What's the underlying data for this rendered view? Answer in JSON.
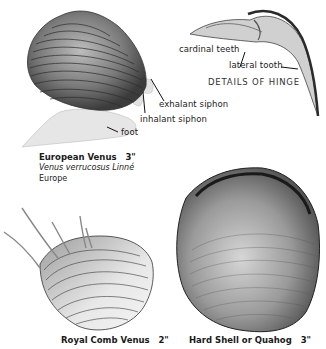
{
  "labels": {
    "cardinal_teeth": "cardinal teeth",
    "lateral_tooth": "lateral tooth",
    "details_of_hinge": "DETAILS OF HINGE",
    "exhalant_siphon": "exhalant siphon",
    "inhalant_siphon": "inhalant siphon",
    "foot": "foot"
  },
  "species": [
    {
      "common_name": "European Venus",
      "size": "3\"",
      "scientific_name": "Venus verrucosus Linné",
      "range": "Europe"
    },
    {
      "common_name": "Royal Comb Venus",
      "size": "2\""
    },
    {
      "common_name": "Hard Shell or Quahog",
      "size": "3\""
    }
  ],
  "colors": {
    "background": "#ffffff",
    "shell_dark": "#4a4a4a",
    "shell_mid": "#8a8a8a",
    "foot_light": "#e4e4e4",
    "text": "#1a1a1a"
  }
}
